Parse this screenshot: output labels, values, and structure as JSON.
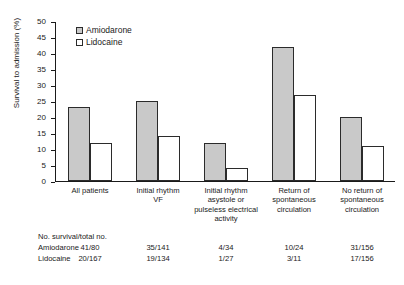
{
  "chart_data": {
    "type": "bar",
    "title": "",
    "xlabel": "",
    "ylabel": "Survival to admission (%)",
    "ylim": [
      0,
      50
    ],
    "ytick_step": 5,
    "yticks": [
      0,
      5,
      10,
      15,
      20,
      25,
      30,
      35,
      40,
      45,
      50
    ],
    "grid": false,
    "legend_position": "top-left inside",
    "categories": [
      "All patients",
      "Initial rhythm VF",
      "Initial rhythm asystole or pulseless electrical activity",
      "Return of spontaneous circulation",
      "No return of spontaneous circulation"
    ],
    "category_lines": [
      [
        "All patients"
      ],
      [
        "Initial rhythm",
        "VF"
      ],
      [
        "Initial rhythm",
        "asystole or",
        "pulseless electrical",
        "activity"
      ],
      [
        "Return of",
        "spontaneous",
        "circulation"
      ],
      [
        "No return of",
        "spontaneous",
        "circulation"
      ]
    ],
    "series": [
      {
        "name": "Amiodarone",
        "color": "#c9c9c9",
        "values": [
          23,
          25,
          12,
          42,
          20
        ]
      },
      {
        "name": "Lidocaine",
        "color": "#ffffff",
        "values": [
          12,
          14,
          4,
          27,
          11
        ]
      }
    ]
  },
  "legend": {
    "items": [
      {
        "label": "Amiodarone",
        "swatch": "gray-filled-square"
      },
      {
        "label": "Lidocaine",
        "swatch": "white-square"
      }
    ]
  },
  "table": {
    "caption": "No. survival/total no.",
    "rows": [
      {
        "label": "Amiodarone",
        "values": [
          "41/80",
          "35/141",
          "4/34",
          "10/24",
          "31/156"
        ]
      },
      {
        "label": "Lidocaine",
        "values": [
          "20/167",
          "19/134",
          "1/27",
          "3/11",
          "17/156"
        ]
      }
    ]
  }
}
